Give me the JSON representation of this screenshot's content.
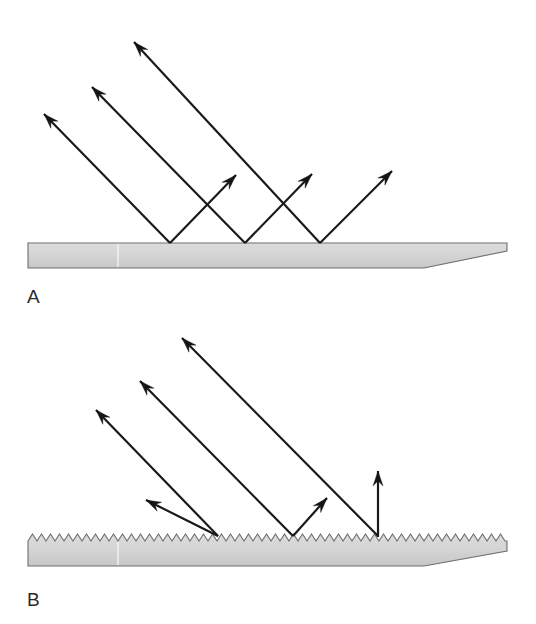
{
  "figure": {
    "background_color": "#ffffff",
    "width": 536,
    "height": 624
  },
  "style": {
    "ray_color": "#1a1a1a",
    "arrow_color": "#141414",
    "slab_fill_top": "#d8d8d8",
    "slab_fill_bottom": "#c9c9c9",
    "slab_stroke": "#6e6e6e",
    "label_color": "#2b2b2b",
    "ray_width": 2.2
  },
  "panels": [
    {
      "id": "panel-a",
      "label": "A",
      "label_pos": {
        "x": 27,
        "y": 303
      },
      "surface": {
        "kind": "smooth",
        "top_y": 243,
        "bottom_y": 268,
        "left_x": 28,
        "right_x": 507,
        "taper_start_x": 424,
        "seam_x": 118,
        "teeth": 0
      },
      "rays": [
        {
          "name": "incident-ray-1",
          "from": {
            "x": 170,
            "y": 243
          },
          "to": {
            "x": 44,
            "y": 114
          },
          "arrow_at": "to",
          "kind": "incident",
          "head_style": "barbed"
        },
        {
          "name": "incident-ray-2",
          "from": {
            "x": 245,
            "y": 243
          },
          "to": {
            "x": 92,
            "y": 87
          },
          "arrow_at": "to",
          "kind": "incident",
          "head_style": "barbed"
        },
        {
          "name": "incident-ray-3",
          "from": {
            "x": 320,
            "y": 243
          },
          "to": {
            "x": 134,
            "y": 42
          },
          "arrow_at": "to",
          "kind": "incident",
          "head_style": "barbed"
        },
        {
          "name": "reflected-ray-1",
          "from": {
            "x": 170,
            "y": 243
          },
          "to": {
            "x": 236,
            "y": 175
          },
          "arrow_at": "to",
          "kind": "reflected",
          "head_style": "barbed"
        },
        {
          "name": "reflected-ray-2",
          "from": {
            "x": 245,
            "y": 243
          },
          "to": {
            "x": 312,
            "y": 174
          },
          "arrow_at": "to",
          "kind": "reflected",
          "head_style": "barbed"
        },
        {
          "name": "reflected-ray-3",
          "from": {
            "x": 320,
            "y": 243
          },
          "to": {
            "x": 392,
            "y": 171
          },
          "arrow_at": "to",
          "kind": "reflected",
          "head_style": "barbed"
        }
      ]
    },
    {
      "id": "panel-b",
      "label": "B",
      "label_pos": {
        "x": 27,
        "y": 606
      },
      "surface": {
        "kind": "rough",
        "top_y": 541,
        "peak_y": 534,
        "bottom_y": 566,
        "left_x": 28,
        "right_x": 507,
        "taper_start_x": 424,
        "seam_x": 118,
        "teeth": 53,
        "tooth_width": 9
      },
      "rays": [
        {
          "name": "incident-ray-1",
          "from": {
            "x": 218,
            "y": 536
          },
          "to": {
            "x": 96,
            "y": 410
          },
          "arrow_at": "to",
          "kind": "incident",
          "head_style": "barbed"
        },
        {
          "name": "incident-ray-2",
          "from": {
            "x": 293,
            "y": 536
          },
          "to": {
            "x": 140,
            "y": 381
          },
          "arrow_at": "to",
          "kind": "incident",
          "head_style": "barbed"
        },
        {
          "name": "incident-ray-3",
          "from": {
            "x": 378,
            "y": 536
          },
          "to": {
            "x": 182,
            "y": 338
          },
          "arrow_at": "to",
          "kind": "incident",
          "head_style": "barbed"
        },
        {
          "name": "reflected-ray-1",
          "from": {
            "x": 218,
            "y": 536
          },
          "to": {
            "x": 146,
            "y": 500
          },
          "arrow_at": "to",
          "kind": "reflected",
          "head_style": "barbed"
        },
        {
          "name": "reflected-ray-2",
          "from": {
            "x": 293,
            "y": 536
          },
          "to": {
            "x": 327,
            "y": 498
          },
          "arrow_at": "to",
          "kind": "reflected",
          "head_style": "barbed"
        },
        {
          "name": "reflected-ray-3",
          "from": {
            "x": 378,
            "y": 537
          },
          "to": {
            "x": 378,
            "y": 471
          },
          "arrow_at": "to",
          "kind": "reflected",
          "head_style": "barbed"
        }
      ]
    }
  ]
}
